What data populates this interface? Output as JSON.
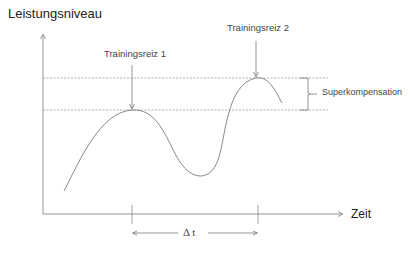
{
  "diagram": {
    "title": "Superkompensation",
    "y_axis_label": "Leistungsniveau",
    "x_axis_label": "Zeit",
    "annotations": {
      "stimulus_1": "Trainingsreiz 1",
      "stimulus_2": "Trainingsreiz 2",
      "supercompensation": "Superkompensation",
      "delta_t": "Δ t"
    },
    "colors": {
      "line": "#7a7a7a",
      "dashed": "#9a9a9a",
      "text": "#333333"
    }
  }
}
